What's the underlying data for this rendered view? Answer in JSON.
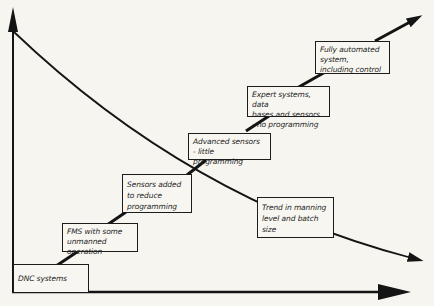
{
  "diagram": {
    "type": "staircase-evolution-diagram",
    "colors": {
      "background": "#f6f5f0",
      "line": "#141414",
      "box_border": "#1c1c1c",
      "box_fill": "#f7f6f1",
      "text": "#1e1e1e"
    },
    "axes": {
      "vertical_axis": "unlabeled",
      "horizontal_axis": "unlabeled"
    },
    "boxes": [
      {
        "id": "dnc-systems",
        "label": "DNC systems"
      },
      {
        "id": "fms",
        "label": "FMS with some\nunmanned operation"
      },
      {
        "id": "sensors-added",
        "label": "Sensors added\nto reduce\nprogramming"
      },
      {
        "id": "advanced-sensors",
        "label": "Advanced sensors\n- little programming"
      },
      {
        "id": "expert-systems",
        "label": "Expert systems, data\nbases and sensors\n- no programming"
      },
      {
        "id": "fully-automated",
        "label": "Fully automated\nsystem,\nincluding control"
      },
      {
        "id": "trend-note",
        "label": "Trend in manning\nlevel and batch\nsize"
      }
    ]
  }
}
